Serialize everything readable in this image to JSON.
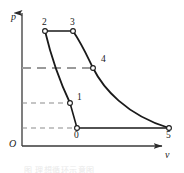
{
  "figure": {
    "kind": "pressure-volume-diagram",
    "axes": {
      "y_label": "p",
      "x_label": "v",
      "origin_label": "O"
    },
    "caption": "图  理想循环示意图",
    "colors": {
      "curve": "#1a1a1a",
      "axis": "#3a3a3a",
      "dashed_thin": "#8c8c8c",
      "dashed_thick": "#9a9a9a",
      "marker_fill": "#ffffff",
      "background": "#ffffff"
    }
  },
  "chart_data": {
    "type": "line",
    "title": "",
    "xlabel": "v",
    "ylabel": "p",
    "grid": false,
    "legend": "none",
    "xlim": [
      0,
      184
    ],
    "ylim": [
      0,
      173
    ],
    "annotations": [
      "2-3 constant pressure",
      "3-4-5 expansion",
      "2-1 compression line",
      "0-5 constant pressure"
    ],
    "points": [
      {
        "label": "2",
        "x": 45,
        "y": 31,
        "label_dx": -3,
        "label_dy": -13
      },
      {
        "label": "3",
        "x": 73,
        "y": 31,
        "label_dx": -3,
        "label_dy": -13
      },
      {
        "label": "4",
        "x": 93,
        "y": 68,
        "label_dx": 8,
        "label_dy": -13
      },
      {
        "label": "1",
        "x": 70,
        "y": 103,
        "label_dx": 7,
        "label_dy": -10
      },
      {
        "label": "0",
        "x": 77,
        "y": 128,
        "label_dx": -3,
        "label_dy": 3
      },
      {
        "label": "5",
        "x": 169,
        "y": 128,
        "label_dx": -3,
        "label_dy": 3
      }
    ],
    "series": [
      {
        "name": "segment-2-3",
        "kind": "straight",
        "path": "M 45 31 L 73 31"
      },
      {
        "name": "curve-3-4-5",
        "kind": "curve",
        "path": "M 73 31 C 83 46 88 58 93 68 C 103 88 126 115 169 128"
      },
      {
        "name": "curve-2-1",
        "kind": "curve",
        "path": "M 45 31 C 50 52 60 82 70 103"
      },
      {
        "name": "segment-1-0",
        "kind": "straight",
        "path": "M 70 103 L 77 128"
      },
      {
        "name": "segment-0-5",
        "kind": "straight",
        "path": "M 77 128 L 169 128"
      }
    ],
    "guides": [
      {
        "name": "guide-to-4",
        "y": 68,
        "x_start": 22,
        "x_end": 93,
        "style": "long-dash",
        "width": 2.0
      },
      {
        "name": "guide-to-1",
        "y": 103,
        "x_start": 22,
        "x_end": 70,
        "style": "dash",
        "width": 1.0
      },
      {
        "name": "guide-to-0",
        "y": 128,
        "x_start": 22,
        "x_end": 77,
        "style": "dash",
        "width": 1.0
      }
    ],
    "axis_geometry": {
      "y_axis": {
        "x": 22,
        "y_top": 12,
        "y_bottom": 146
      },
      "x_axis": {
        "y": 146,
        "x_left": 22,
        "x_right": 163
      }
    }
  }
}
